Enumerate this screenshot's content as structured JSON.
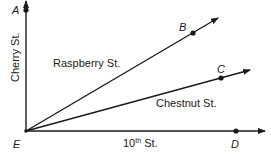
{
  "diagram": {
    "colors": {
      "line": "#1a1a1a",
      "text": "#1a1a1a",
      "background": "#ffffff"
    },
    "points": {
      "A": {
        "label": "A",
        "x": 26,
        "y": 10
      },
      "B": {
        "label": "B",
        "x": 193,
        "y": 33
      },
      "C": {
        "label": "C",
        "x": 221,
        "y": 78
      },
      "D": {
        "label": "D",
        "x": 236,
        "y": 131
      },
      "E": {
        "label": "E",
        "x": 26,
        "y": 131
      }
    },
    "streets": {
      "cherry": {
        "label": "Cherry St."
      },
      "raspberry": {
        "label": "Raspberry St."
      },
      "chestnut": {
        "label": "Chestnut St."
      },
      "tenth": {
        "label_num": "10",
        "label_sup": "th",
        "label_rest": " St."
      }
    }
  }
}
